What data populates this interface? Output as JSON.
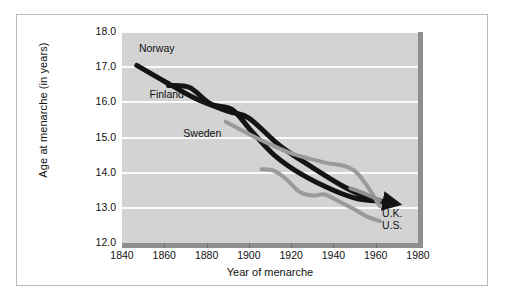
{
  "figure": {
    "background": "#ffffff",
    "frame_color": "#b9b9b9",
    "plot_background": "#d3d3d3",
    "gridline_color": "#fbfbfb",
    "shadow_color": "#8e8e8e"
  },
  "chart_data": {
    "type": "line",
    "title": "",
    "xlabel": "Year of menarche",
    "ylabel": "Age at menarche (in years)",
    "xlim": [
      1840,
      1980
    ],
    "ylim": [
      12.0,
      18.0
    ],
    "xticks": [
      1840,
      1860,
      1880,
      1900,
      1920,
      1940,
      1960,
      1980
    ],
    "xtick_labels": [
      "1840",
      "1860",
      "1880",
      "1900",
      "1920",
      "1940",
      "1960",
      "1980"
    ],
    "yticks": [
      12.0,
      13.0,
      14.0,
      15.0,
      16.0,
      17.0,
      18.0
    ],
    "ytick_labels": [
      "12.0",
      "13.0",
      "14.0",
      "15.0",
      "16.0",
      "17.0",
      "18.0"
    ],
    "grid": true,
    "grid_axis": "y",
    "legend": "inline-labels",
    "series": [
      {
        "name": "Norway",
        "color": "#141414",
        "width": 5,
        "label_position": {
          "x": 1848,
          "y": 17.55
        },
        "marker_end": "arrow",
        "x": [
          1847,
          1860,
          1875,
          1890,
          1900,
          1915,
          1930,
          1945,
          1958,
          1967
        ],
        "y": [
          17.05,
          16.6,
          16.1,
          15.75,
          15.55,
          14.75,
          14.15,
          13.6,
          13.25,
          13.15
        ]
      },
      {
        "name": "Finland",
        "color": "#141414",
        "width": 5,
        "label_position": {
          "x": 1853,
          "y": 16.25
        },
        "marker_end": "none",
        "x": [
          1862,
          1872,
          1882,
          1892,
          1901,
          1912,
          1925,
          1940,
          1952,
          1962
        ],
        "y": [
          16.48,
          16.42,
          15.95,
          15.8,
          15.2,
          14.5,
          13.95,
          13.5,
          13.25,
          13.2
        ]
      },
      {
        "name": "Sweden",
        "color": "#9a9a9a",
        "width": 4,
        "label_position": {
          "x": 1869,
          "y": 15.12
        },
        "marker_end": "none",
        "x": [
          1889,
          1905,
          1920,
          1935,
          1950,
          1962
        ],
        "y": [
          15.45,
          14.95,
          14.55,
          14.3,
          14.05,
          13.05
        ]
      },
      {
        "name": "U.K.",
        "color": "#8f8f8f",
        "width": 4,
        "label_position": {
          "x": 1963,
          "y": 12.85
        },
        "marker_end": "none",
        "x": [
          1948,
          1955,
          1962
        ],
        "y": [
          13.55,
          13.4,
          13.22
        ]
      },
      {
        "name": "U.S.",
        "color": "#9a9a9a",
        "width": 4,
        "label_position": {
          "x": 1963,
          "y": 12.5
        },
        "marker_end": "none",
        "x": [
          1906,
          1912,
          1918,
          1924,
          1930,
          1936,
          1942,
          1950,
          1956,
          1962
        ],
        "y": [
          14.1,
          14.05,
          13.8,
          13.45,
          13.35,
          13.38,
          13.2,
          12.95,
          12.75,
          12.62
        ]
      }
    ]
  }
}
